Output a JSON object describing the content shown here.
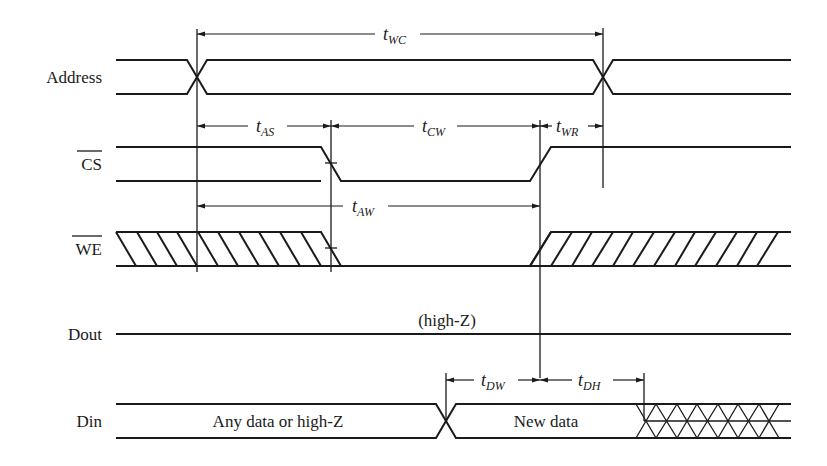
{
  "colors": {
    "line": "#1a1a1a",
    "background": "#ffffff"
  },
  "signals": [
    {
      "id": "address",
      "label": "Address",
      "overbar": false
    },
    {
      "id": "cs",
      "label": "CS",
      "overbar": true
    },
    {
      "id": "we",
      "label": "WE",
      "overbar": true
    },
    {
      "id": "dout",
      "label": "Dout",
      "overbar": false
    },
    {
      "id": "din",
      "label": "Din",
      "overbar": false
    }
  ],
  "timing_params": [
    {
      "id": "twc",
      "main": "t",
      "sub": "WC"
    },
    {
      "id": "tas",
      "main": "t",
      "sub": "AS"
    },
    {
      "id": "tcw",
      "main": "t",
      "sub": "CW"
    },
    {
      "id": "twr",
      "main": "t",
      "sub": "WR"
    },
    {
      "id": "taw",
      "main": "t",
      "sub": "AW"
    },
    {
      "id": "tdw",
      "main": "t",
      "sub": "DW"
    },
    {
      "id": "tdh",
      "main": "t",
      "sub": "DH"
    }
  ],
  "annotations": {
    "dout_state": "(high-Z)",
    "din_before": "Any data or high-Z",
    "din_valid": "New data"
  }
}
